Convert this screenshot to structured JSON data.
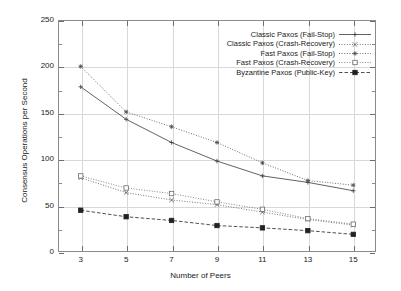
{
  "chart_data": {
    "type": "line",
    "title": "",
    "xlabel": "Number of Peers",
    "ylabel": "Consensus Operations per Second",
    "x": [
      3,
      5,
      7,
      9,
      11,
      13,
      15
    ],
    "xticklabels": [
      "3",
      "5",
      "7",
      "9",
      "11",
      "13",
      "15"
    ],
    "yticklabels": [
      "0",
      "50",
      "100",
      "150",
      "200",
      "250"
    ],
    "yticks": [
      0,
      50,
      100,
      150,
      200,
      250
    ],
    "xlim": [
      2,
      16
    ],
    "ylim": [
      0,
      250
    ],
    "grid": true,
    "legend_position": "top-right-inside",
    "series": [
      {
        "name": "Classic Paxos (Fail-Stop)",
        "marker": "plus",
        "linestyle": "solid",
        "color": "#3a3a3a",
        "values": [
          178,
          143,
          118,
          98,
          82,
          75,
          66
        ]
      },
      {
        "name": "Classic Paxos (Crash-Recovery)",
        "marker": "cross",
        "linestyle": "dotted",
        "color": "#555555",
        "values": [
          80,
          64,
          56,
          51,
          43,
          35,
          29
        ]
      },
      {
        "name": "Fast Paxos (Fail-Stop)",
        "marker": "star",
        "linestyle": "dotted",
        "color": "#4a4a4a",
        "values": [
          200,
          151,
          135,
          118,
          96,
          77,
          72
        ]
      },
      {
        "name": "Fast Paxos (Crash-Recovery)",
        "marker": "open-square",
        "linestyle": "dotted",
        "color": "#6a6a6a",
        "values": [
          82,
          69,
          63,
          54,
          46,
          36,
          30
        ]
      },
      {
        "name": "Byzantine Paxos (Public-Key)",
        "marker": "filled-square",
        "linestyle": "dashed",
        "color": "#222222",
        "values": [
          45,
          38,
          34,
          28.5,
          26,
          23,
          19
        ]
      }
    ]
  },
  "axes": {
    "y_title": "Consensus Operations per Second",
    "x_title": "Number of Peers",
    "y_ticks": [
      {
        "label": "250",
        "value": 250
      },
      {
        "label": "200",
        "value": 200
      },
      {
        "label": "150",
        "value": 150
      },
      {
        "label": "100",
        "value": 100
      },
      {
        "label": "50",
        "value": 50
      },
      {
        "label": "0",
        "value": 0
      }
    ],
    "x_ticks": [
      {
        "label": "3",
        "value": 3
      },
      {
        "label": "5",
        "value": 5
      },
      {
        "label": "7",
        "value": 7
      },
      {
        "label": "9",
        "value": 9
      },
      {
        "label": "11",
        "value": 11
      },
      {
        "label": "13",
        "value": 13
      },
      {
        "label": "15",
        "value": 15
      }
    ]
  },
  "legend": {
    "entries": [
      {
        "label": "Classic Paxos (Fail-Stop)"
      },
      {
        "label": "Classic Paxos (Crash-Recovery)"
      },
      {
        "label": "Fast Paxos (Fail-Stop)"
      },
      {
        "label": "Fast Paxos (Crash-Recovery)"
      },
      {
        "label": "Byzantine Paxos (Public-Key)"
      }
    ]
  }
}
